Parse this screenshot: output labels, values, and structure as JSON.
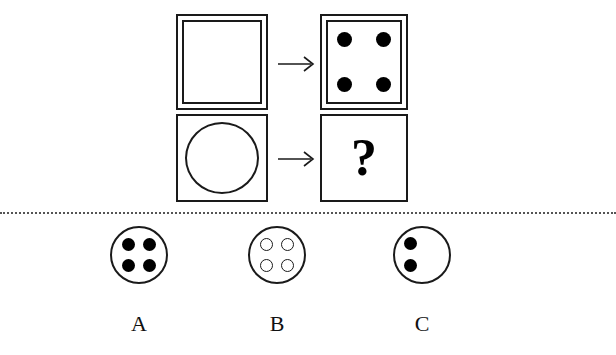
{
  "puzzle": {
    "type": "visual-analogy-matrix",
    "matrix": {
      "rows": [
        {
          "source": {
            "shape": "square",
            "border": "double",
            "contents": "empty",
            "dots": 0,
            "description": "empty double-bordered square"
          },
          "arrow": "→",
          "target": {
            "shape": "square",
            "border": "double",
            "contents": "four-filled-dots",
            "dots": 4,
            "dot_style": "filled",
            "description": "double-bordered square with four filled corner dots"
          }
        },
        {
          "source": {
            "shape": "circle-in-square",
            "border": "single",
            "contents": "empty-circle",
            "dots": 0,
            "description": "single-bordered square containing an empty circle"
          },
          "arrow": "→",
          "target": {
            "shape": "square",
            "border": "single",
            "contents": "question",
            "question_mark": "?",
            "description": "single-bordered square with a question mark"
          }
        }
      ]
    },
    "options": [
      {
        "id": "A",
        "label": "A",
        "shape": "circle",
        "dot_count": 4,
        "dot_style": "filled",
        "dot_positions": [
          "top-left",
          "top-right",
          "bottom-left",
          "bottom-right"
        ]
      },
      {
        "id": "B",
        "label": "B",
        "shape": "circle",
        "dot_count": 4,
        "dot_style": "hollow",
        "dot_positions": [
          "top-left",
          "top-right",
          "bottom-left",
          "bottom-right"
        ]
      },
      {
        "id": "C",
        "label": "C",
        "shape": "circle",
        "dot_count": 2,
        "dot_style": "filled",
        "dot_positions": [
          "upper-left",
          "lower-left"
        ]
      }
    ],
    "divider": {
      "style": "dotted",
      "color": "#555555"
    },
    "colors": {
      "stroke": "#1a1a1a",
      "fill": "#000000",
      "background": "#ffffff",
      "divider": "#555555"
    }
  }
}
